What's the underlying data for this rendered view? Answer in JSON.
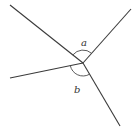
{
  "diagram": {
    "vertex": {
      "x": 83,
      "y": 63
    },
    "rays": [
      {
        "name": "upper-left",
        "x1": 10,
        "y1": 5,
        "x2": 83,
        "y2": 63
      },
      {
        "name": "upper-right",
        "x1": 83,
        "y1": 63,
        "x2": 131,
        "y2": 9
      },
      {
        "name": "left",
        "x1": 10,
        "y1": 78,
        "x2": 83,
        "y2": 63
      },
      {
        "name": "lower-right",
        "x1": 83,
        "y1": 63,
        "x2": 120,
        "y2": 126
      }
    ],
    "angles": [
      {
        "name": "a",
        "label": "a",
        "label_x": 81,
        "label_y": 46,
        "position": "between upper-left and upper-right rays"
      },
      {
        "name": "b",
        "label": "b",
        "label_x": 74,
        "label_y": 93,
        "position": "between left and lower-right rays"
      }
    ],
    "colors": {
      "line": "#3a3a3a",
      "background": "#ffffff"
    }
  }
}
